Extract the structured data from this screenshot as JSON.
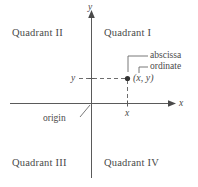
{
  "diagram": {
    "colors": {
      "background": "#ffffff",
      "axis": "#5a5a5a",
      "text": "#4a4a4a",
      "dashed": "#6e6e6e",
      "point": "#333333"
    },
    "quadrants": [
      {
        "id": "quadrant-2",
        "label": "Quadrant II"
      },
      {
        "id": "quadrant-1",
        "label": "Quadrant I"
      },
      {
        "id": "quadrant-3",
        "label": "Quadrant III"
      },
      {
        "id": "quadrant-4",
        "label": "Quadrant IV"
      }
    ],
    "axes": {
      "x_label": "x",
      "y_label": "y"
    },
    "ticks": {
      "x_tick_label": "x",
      "y_tick_label": "y"
    },
    "point": {
      "label": "(x, y)"
    },
    "annotations": {
      "abscissa": "abscissa",
      "ordinate": "ordinate",
      "origin": "origin"
    }
  }
}
